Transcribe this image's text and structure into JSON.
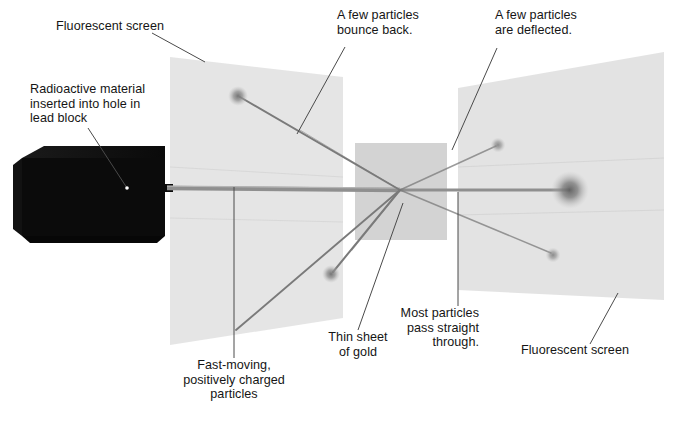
{
  "figure": {
    "background_color": "#ffffff",
    "text_color": "#151515",
    "screen_color": "#e3e3e3",
    "foil_color": "#c9c9c9",
    "lead_block_color": "#0d0d0d",
    "beam_color": "#8a8a8a",
    "leader_color": "#5d5d5d"
  },
  "labels": {
    "fluorescent_screen_left": "Fluorescent screen",
    "radioactive_material": "Radioactive material\ninserted into hole in\nlead block",
    "bounce_back": "A few particles\nbounce back.",
    "deflected": "A few particles\nare deflected.",
    "fast_moving": "Fast-moving,\npositively charged\nparticles",
    "thin_sheet": "Thin sheet\nof gold",
    "most_particles": "Most particles\npass straight\nthrough.",
    "fluorescent_screen_right": "Fluorescent screen"
  },
  "label_lines": {
    "fluorescent_screen_left": [
      "Fluorescent screen"
    ],
    "radioactive_material": [
      "Radioactive material",
      "inserted into hole in",
      "lead block"
    ],
    "bounce_back": [
      "A few particles",
      "bounce back."
    ],
    "deflected": [
      "A few particles",
      "are deflected."
    ],
    "fast_moving": [
      "Fast-moving,",
      "positively charged",
      "particles"
    ],
    "thin_sheet": [
      "Thin sheet",
      "of gold"
    ],
    "most_particles": [
      "Most particles",
      "pass straight",
      "through."
    ],
    "fluorescent_screen_right": [
      "Fluorescent screen"
    ]
  },
  "components": {
    "lead_block": "lead-block",
    "left_screen": "left-fluorescent-screen",
    "right_screen": "right-fluorescent-screen",
    "gold_foil": "thin-gold-foil",
    "beam": "alpha-particle-beam",
    "scatter_point": "scattering-point"
  },
  "particle_spots": [
    {
      "name": "backscatter-spot-upper-left",
      "x": 238,
      "y": 96,
      "r": 6.0
    },
    {
      "name": "backscatter-spot-lower-left",
      "x": 331,
      "y": 274,
      "r": 5.2
    },
    {
      "name": "deflected-spot-upper-right",
      "x": 498,
      "y": 145,
      "r": 4.6
    },
    {
      "name": "deflected-spot-lower-right",
      "x": 553,
      "y": 255,
      "r": 4.6
    },
    {
      "name": "undeflected-central-spot",
      "x": 570,
      "y": 190,
      "r": 11.5
    }
  ]
}
